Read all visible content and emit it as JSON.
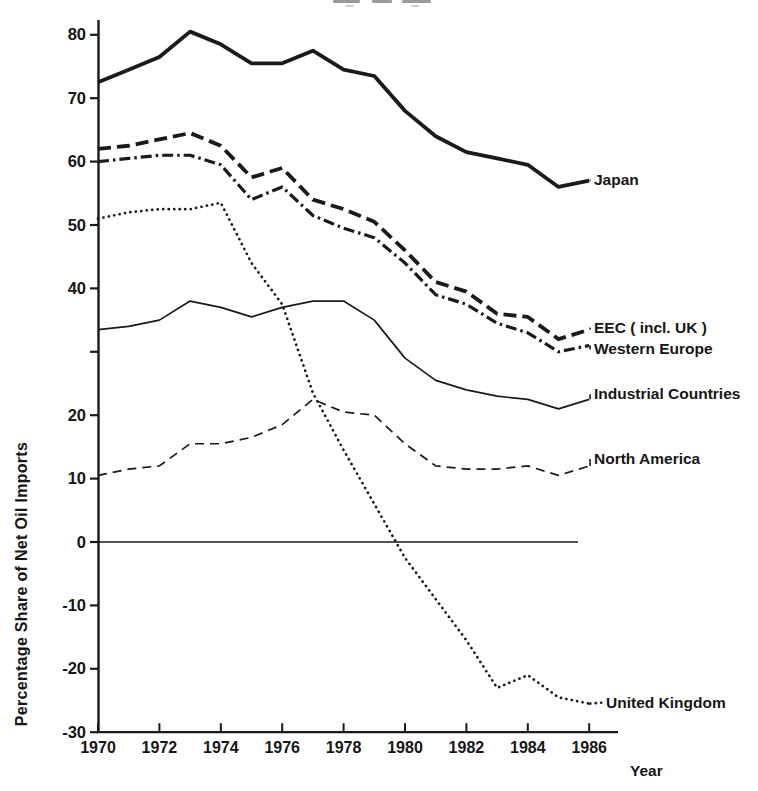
{
  "chart_data": {
    "type": "line",
    "title": "",
    "xlabel": "Year",
    "ylabel": "Percentage Share of Net Oil Imports",
    "xlim": [
      1970,
      1986
    ],
    "ylim": [
      -30,
      82
    ],
    "grid": false,
    "zero_line": true,
    "legend_position": "labels-at-line-ends",
    "x": [
      1970,
      1971,
      1972,
      1973,
      1974,
      1975,
      1976,
      1977,
      1978,
      1979,
      1980,
      1981,
      1982,
      1983,
      1984,
      1985,
      1986
    ],
    "x_tick_labels": [
      "1970",
      "1972",
      "1974",
      "1976",
      "1978",
      "1980",
      "1982",
      "1984",
      "1986"
    ],
    "x_tick_values": [
      1970,
      1972,
      1974,
      1976,
      1978,
      1980,
      1982,
      1984,
      1986
    ],
    "y_ticks": [
      {
        "value": 80,
        "label": "80"
      },
      {
        "value": 70,
        "label": "70"
      },
      {
        "value": 60,
        "label": "60"
      },
      {
        "value": 50,
        "label": "50"
      },
      {
        "value": 40,
        "label": "40"
      },
      {
        "value": 30,
        "label": ""
      },
      {
        "value": 20,
        "label": "20"
      },
      {
        "value": 10,
        "label": "10"
      },
      {
        "value": 0,
        "label": "0"
      },
      {
        "value": -10,
        "label": "-10"
      },
      {
        "value": -20,
        "label": "-20"
      },
      {
        "value": -30,
        "label": "-30"
      }
    ],
    "series": [
      {
        "name": "Japan",
        "style": "solid-thick",
        "values": [
          72.5,
          74.5,
          76.5,
          80.5,
          78.5,
          75.5,
          75.5,
          77.5,
          74.5,
          73.5,
          68,
          64,
          61.5,
          60.5,
          59.5,
          56,
          57
        ]
      },
      {
        "name": "EEC ( incl. UK )",
        "style": "dashed-thick",
        "values": [
          62,
          62.5,
          63.5,
          64.5,
          62.5,
          57.5,
          59,
          54,
          52.5,
          50.5,
          46,
          41,
          39.5,
          36,
          35.5,
          32,
          33.5
        ]
      },
      {
        "name": "Western Europe",
        "style": "dashdot-thick",
        "values": [
          60,
          60.5,
          61,
          61,
          59.5,
          54,
          56,
          51.5,
          49.5,
          48,
          44,
          39,
          37.5,
          34.5,
          33,
          30,
          31
        ]
      },
      {
        "name": "Industrial Countries",
        "style": "solid-thin",
        "values": [
          33.5,
          34,
          35,
          38,
          37,
          35.5,
          37,
          38,
          38,
          35,
          29,
          25.5,
          24,
          23,
          22.5,
          21,
          22.5
        ]
      },
      {
        "name": "North America",
        "style": "dashed-thin",
        "values": [
          10.5,
          11.5,
          12,
          15.5,
          15.5,
          16.5,
          18.5,
          22.5,
          20.5,
          20,
          15.5,
          12,
          11.5,
          11.5,
          12,
          10.5,
          12
        ]
      },
      {
        "name": "United Kingdom",
        "style": "dotted",
        "values": [
          51,
          52,
          52.5,
          52.5,
          53.5,
          44,
          37.5,
          23.5,
          14.5,
          6,
          -2.5,
          -9,
          -15.5,
          -23,
          -21,
          -24.5,
          -25.5
        ]
      }
    ],
    "colors": {
      "line": "#1a1a1a",
      "background": "#ffffff"
    }
  }
}
